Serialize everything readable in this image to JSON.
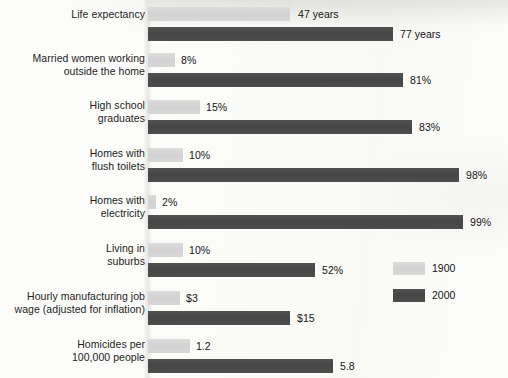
{
  "chart_data": {
    "type": "bar",
    "orientation": "horizontal",
    "title": "",
    "subtitle": "",
    "xlabel": "",
    "ylabel": "",
    "grid": false,
    "legend_position": "right-lower",
    "categories": [
      "Life expectancy",
      "Married women working outside the home",
      "High school graduates",
      "Homes with flush toilets",
      "Homes with electricity",
      "Living in suburbs",
      "Hourly manufacturing job wage (adjusted for inflation)",
      "Homicides per 100,000 people"
    ],
    "series": [
      {
        "name": "1900",
        "color": "#d6d6d6",
        "values": [
          47,
          8,
          15,
          10,
          2,
          10,
          3,
          1.2
        ],
        "value_labels": [
          "47 years",
          "8%",
          "15%",
          "10%",
          "2%",
          "10%",
          "$3",
          "1.2"
        ]
      },
      {
        "name": "2000",
        "color": "#4a4a4a",
        "values": [
          77,
          81,
          83,
          98,
          99,
          52,
          15,
          5.8
        ],
        "value_labels": [
          "77 years",
          "81%",
          "83%",
          "98%",
          "99%",
          "52%",
          "$15",
          "5.8"
        ]
      }
    ]
  },
  "groups": [
    {
      "label_line1": "Life expectancy",
      "label_line2": "",
      "top": 2,
      "label_top": 8,
      "light": {
        "bar_top": 7,
        "bar_width": 142,
        "value": "47 years",
        "value_left": 298
      },
      "dark": {
        "bar_top": 27,
        "bar_width": 245,
        "value": "77 years",
        "value_left": 400
      }
    },
    {
      "label_line1": "Married women working",
      "label_line2": "outside the home",
      "top": 50,
      "label_top": 52,
      "light": {
        "bar_top": 53,
        "bar_width": 27,
        "value": "8%",
        "value_left": 181
      },
      "dark": {
        "bar_top": 73,
        "bar_width": 255,
        "value": "81%",
        "value_left": 410
      }
    },
    {
      "label_line1": "High school",
      "label_line2": "graduates",
      "top": 97,
      "label_top": 99,
      "light": {
        "bar_top": 100,
        "bar_width": 52,
        "value": "15%",
        "value_left": 206
      },
      "dark": {
        "bar_top": 120,
        "bar_width": 264,
        "value": "83%",
        "value_left": 419
      }
    },
    {
      "label_line1": "Homes with",
      "label_line2": "flush toilets",
      "top": 145,
      "label_top": 147,
      "light": {
        "bar_top": 148,
        "bar_width": 35,
        "value": "10%",
        "value_left": 189
      },
      "dark": {
        "bar_top": 168,
        "bar_width": 311,
        "value": "98%",
        "value_left": 466
      }
    },
    {
      "label_line1": "Homes with",
      "label_line2": "electricity",
      "top": 192,
      "label_top": 194,
      "light": {
        "bar_top": 195,
        "bar_width": 8,
        "value": "2%",
        "value_left": 162
      },
      "dark": {
        "bar_top": 215,
        "bar_width": 315,
        "value": "99%",
        "value_left": 470
      }
    },
    {
      "label_line1": "Living in",
      "label_line2": "suburbs",
      "top": 240,
      "label_top": 242,
      "light": {
        "bar_top": 243,
        "bar_width": 35,
        "value": "10%",
        "value_left": 189
      },
      "dark": {
        "bar_top": 263,
        "bar_width": 167,
        "value": "52%",
        "value_left": 322
      }
    },
    {
      "label_line1": "Hourly manufacturing job",
      "label_line2": "wage (adjusted for inflation)",
      "top": 288,
      "label_top": 290,
      "light": {
        "bar_top": 291,
        "bar_width": 32,
        "value": "$3",
        "value_left": 186
      },
      "dark": {
        "bar_top": 311,
        "bar_width": 142,
        "value": "$15",
        "value_left": 297
      }
    },
    {
      "label_line1": "Homicides per",
      "label_line2": "100,000 people",
      "top": 336,
      "label_top": 338,
      "light": {
        "bar_top": 339,
        "bar_width": 42,
        "value": "1.2",
        "value_left": 196
      },
      "dark": {
        "bar_top": 359,
        "bar_width": 185,
        "value": "5.8",
        "value_left": 340
      }
    }
  ],
  "legend": {
    "entries": [
      {
        "label": "1900",
        "swatch": "light",
        "top": 0
      },
      {
        "label": "2000",
        "swatch": "dark",
        "top": 27
      }
    ]
  }
}
